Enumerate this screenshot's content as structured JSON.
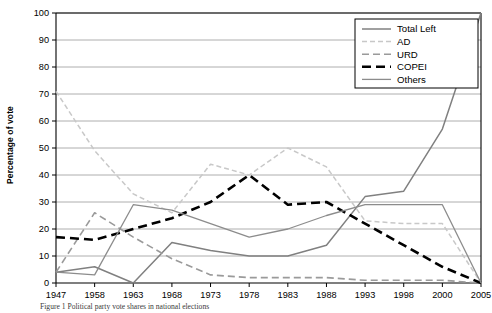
{
  "figure": {
    "ylabel": "Percentage of vote",
    "caption": "Figure 1   Political party vote shares in national elections"
  },
  "chart_data": {
    "type": "line",
    "title": "",
    "xlabel": "",
    "ylabel": "Percentage of vote",
    "categories": [
      "1947",
      "1958",
      "1963",
      "1968",
      "1973",
      "1978",
      "1983",
      "1988",
      "1993",
      "1998",
      "2000",
      "2005"
    ],
    "ylim": [
      0,
      100
    ],
    "ytick_step": 10,
    "yticks": [
      "0",
      "10",
      "20",
      "30",
      "40",
      "50",
      "60",
      "70",
      "80",
      "90",
      "100"
    ],
    "grid": true,
    "grid_axis": "y",
    "legend_position": "top-right",
    "series": [
      {
        "name": "Total Left",
        "color": "#808080",
        "style": "solid",
        "width": 1.5,
        "values": [
          4,
          6,
          0,
          15,
          12,
          10,
          10,
          14,
          32,
          34,
          57,
          100
        ]
      },
      {
        "name": "AD",
        "color": "#c8c8c8",
        "style": "dashed",
        "dash": "5,3",
        "width": 1.5,
        "values": [
          71,
          49,
          33,
          26,
          44,
          40,
          50,
          43,
          23,
          22,
          22,
          0
        ]
      },
      {
        "name": "URD",
        "color": "#9a9a9a",
        "style": "dashed",
        "dash": "7,4",
        "width": 1.6,
        "values": [
          4,
          26,
          17,
          9,
          3,
          2,
          2,
          2,
          1,
          1,
          1,
          0
        ]
      },
      {
        "name": "COPEI",
        "color": "#000000",
        "style": "dashed",
        "dash": "9,5",
        "width": 2.6,
        "values": [
          17,
          16,
          20,
          24,
          30,
          40,
          29,
          30,
          22,
          14,
          6,
          0
        ]
      },
      {
        "name": "Others",
        "color": "#8c8c8c",
        "style": "solid",
        "width": 1.3,
        "values": [
          4,
          3,
          29,
          27,
          22,
          17,
          20,
          25,
          29,
          29,
          29,
          0
        ]
      }
    ]
  },
  "legend": {
    "items": [
      {
        "label": "Total Left"
      },
      {
        "label": "AD"
      },
      {
        "label": "URD"
      },
      {
        "label": "COPEI"
      },
      {
        "label": "Others"
      }
    ]
  }
}
